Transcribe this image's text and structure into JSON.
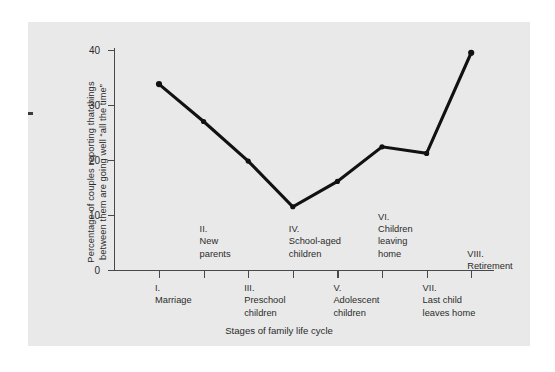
{
  "figure": {
    "background_color": "#e9e9e9",
    "page_background": "#ffffff",
    "line_color": "#111111",
    "axis_color": "#46494b",
    "text_color": "#2b2b2b"
  },
  "chart_data": {
    "type": "line",
    "title": "",
    "xlabel": "Stages of family life cycle",
    "ylabel": "Percentage of couples reporting that things between them are going well “all the time”",
    "ylabel_line1": "Percentage of couples reporting that things",
    "ylabel_line2": "between them are going well “all the time”",
    "ylim": [
      0,
      44
    ],
    "yticks": [
      0,
      10,
      20,
      30,
      40
    ],
    "ytick_labels": [
      "0",
      "10",
      "20",
      "30",
      "40"
    ],
    "grid": false,
    "legend": "none",
    "marker": "filled-circle",
    "categories": [
      "I. Marriage",
      "II. New parents",
      "III. Preschool children",
      "IV. School-aged children",
      "V. Adolescent children",
      "VI. Children leaving home",
      "VII. Last child leaves home",
      "VIII. Retirement"
    ],
    "x": [
      1,
      2,
      3,
      4,
      5,
      6,
      7,
      8
    ],
    "values": [
      33.8,
      27.0,
      19.8,
      11.5,
      16.1,
      22.4,
      21.2,
      39.5
    ],
    "series": [
      {
        "name": "Percentage of couples reporting things going well all the time",
        "values": [
          33.8,
          27.0,
          19.8,
          11.5,
          16.1,
          22.4,
          21.2,
          39.5
        ]
      }
    ]
  },
  "x_stage_labels": [
    {
      "roman": "I.",
      "text": "Marriage",
      "row": "lower",
      "lines": "I.\nMarriage"
    },
    {
      "roman": "II.",
      "text": "New parents",
      "row": "upper",
      "lines": "II.\nNew\nparents"
    },
    {
      "roman": "III.",
      "text": "Preschool children",
      "row": "lower",
      "lines": "III.\nPreschool\nchildren"
    },
    {
      "roman": "IV.",
      "text": "School-aged children",
      "row": "upper",
      "lines": "IV.\nSchool-aged\nchildren"
    },
    {
      "roman": "V.",
      "text": "Adolescent children",
      "row": "lower",
      "lines": "V.\nAdolescent\nchildren"
    },
    {
      "roman": "VI.",
      "text": "Children leaving home",
      "row": "upper",
      "lines": "VI.\nChildren\nleaving\nhome"
    },
    {
      "roman": "VII.",
      "text": "Last child leaves home",
      "row": "lower",
      "lines": "VII.\nLast child\nleaves home"
    },
    {
      "roman": "VIII.",
      "text": "Retirement",
      "row": "upper",
      "lines": "VIII. Retirement"
    }
  ]
}
